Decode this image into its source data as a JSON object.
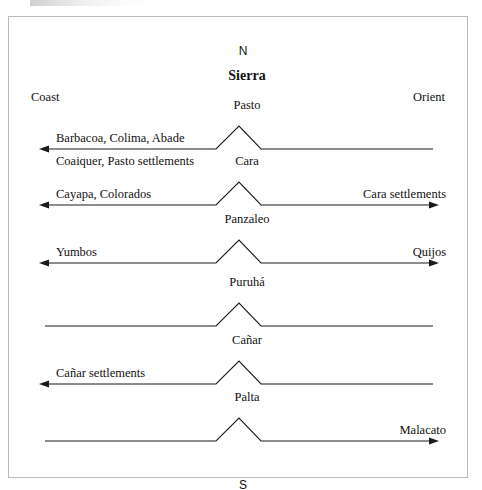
{
  "figure": {
    "compass_north": "N",
    "compass_south": "S",
    "region_title": "Sierra",
    "region_left": "Coast",
    "region_right": "Orient",
    "frame_color": "#b9b9b9",
    "line_color": "#1a1a1a"
  },
  "rows": [
    {
      "peak": "Pasto",
      "left_label": "Barbacoa, Colima, Abade",
      "left_sub_label": "Coaiquer, Pasto settlements",
      "right_label": "",
      "left_arrow": true,
      "right_arrow": false
    },
    {
      "peak": "Cara",
      "left_label": "Cayapa, Colorados",
      "left_sub_label": "",
      "right_label": "Cara settlements",
      "left_arrow": true,
      "right_arrow": true
    },
    {
      "peak": "Panzaleo",
      "left_label": "Yumbos",
      "left_sub_label": "",
      "right_label": "Quijos",
      "left_arrow": true,
      "right_arrow": true
    },
    {
      "peak": "Puruhá",
      "left_label": "",
      "left_sub_label": "",
      "right_label": "",
      "left_arrow": false,
      "right_arrow": false
    },
    {
      "peak": "Cañar",
      "left_label": "Cañar settlements",
      "left_sub_label": "",
      "right_label": "",
      "left_arrow": true,
      "right_arrow": false
    },
    {
      "peak": "Palta",
      "left_label": "",
      "left_sub_label": "",
      "right_label": "Malacato",
      "left_arrow": false,
      "right_arrow": true
    }
  ]
}
